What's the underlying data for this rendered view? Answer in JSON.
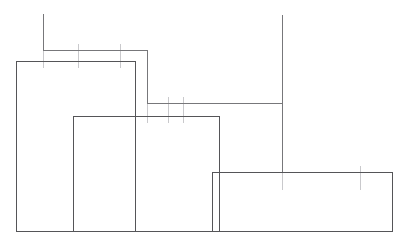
{
  "drawing": {
    "title": "Stepped Profile Line Drawing",
    "canvas": {
      "width": 407,
      "height": 247
    },
    "background_color": "#ffffff",
    "outline_color": "#555558",
    "dimension_color": "#77777a",
    "tick_color": "#c9c9cc",
    "outline_stroke_width": 1,
    "dimension_stroke_width": 1
  },
  "chart_data": {
    "type": "bar",
    "xlabel": "",
    "ylabel": "",
    "grid": false,
    "legend": "none",
    "categories": [
      "A",
      "B",
      "C"
    ],
    "values": [
      170,
      115,
      59
    ],
    "xlim": [
      0,
      407
    ],
    "ylim": [
      0,
      247
    ]
  },
  "shapes": {
    "rectangles": [
      {
        "name": "tall-left-block",
        "label": "Block A",
        "x": 16,
        "y": 61,
        "width": 119,
        "height": 170,
        "points": "16,61 135,61 135,231 16,231 16,61"
      },
      {
        "name": "middle-block",
        "label": "Block B",
        "x": 73,
        "y": 116,
        "width": 146,
        "height": 115,
        "points": "73,116 219,116 219,231 73,231 73,116"
      },
      {
        "name": "low-right-block",
        "label": "Block C",
        "x": 212,
        "y": 172,
        "width": 180,
        "height": 59,
        "points": "212,172 392,172 392,231 212,231 212,172"
      }
    ],
    "baseline": {
      "name": "baseline",
      "label": "Baseline",
      "x1": 16,
      "y1": 231,
      "x2": 392,
      "y2": 231
    },
    "dimension_polylines": [
      {
        "name": "upper-left-dimension-polyline",
        "label": "Upper left dimension leader",
        "points": "43,14 43,50 147,50 147,103 282,103"
      },
      {
        "name": "right-dimension-polyline",
        "label": "Right dimension leader",
        "points": "282,15 282,172 360,172"
      }
    ],
    "tick_marks": [
      {
        "name": "tick-upper-1",
        "x": 43,
        "y1": 44,
        "y2": 68
      },
      {
        "name": "tick-upper-2",
        "x": 78,
        "y1": 44,
        "y2": 68
      },
      {
        "name": "tick-upper-3",
        "x": 120,
        "y1": 44,
        "y2": 68
      },
      {
        "name": "tick-mid-1",
        "x": 147,
        "y1": 97,
        "y2": 123
      },
      {
        "name": "tick-mid-2",
        "x": 168,
        "y1": 97,
        "y2": 123
      },
      {
        "name": "tick-mid-3",
        "x": 183,
        "y1": 97,
        "y2": 123
      },
      {
        "name": "tick-lower-1",
        "x": 282,
        "y1": 166,
        "y2": 190
      },
      {
        "name": "tick-lower-2",
        "x": 360,
        "y1": 166,
        "y2": 190
      }
    ]
  }
}
